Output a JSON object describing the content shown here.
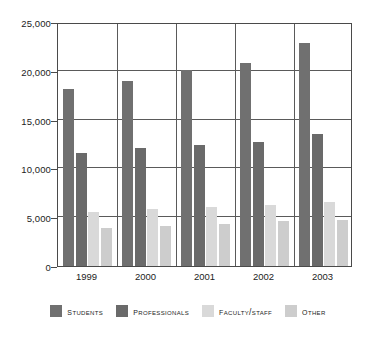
{
  "chart_data": {
    "type": "bar",
    "title": "",
    "xlabel": "",
    "ylabel": "",
    "categories": [
      "1999",
      "2000",
      "2001",
      "2002",
      "2003"
    ],
    "series": [
      {
        "name": "Students",
        "values": [
          18100,
          19000,
          20100,
          20800,
          22800
        ],
        "color": "#707070"
      },
      {
        "name": "Professionals",
        "values": [
          11600,
          12100,
          12400,
          12700,
          13500
        ],
        "color": "#6a6a6a"
      },
      {
        "name": "Faculty/Staff",
        "values": [
          5500,
          5800,
          6000,
          6250,
          6600
        ],
        "color": "#d9d9d9"
      },
      {
        "name": "Other",
        "values": [
          3900,
          4150,
          4350,
          4600,
          4750
        ],
        "color": "#cdcdcd"
      }
    ],
    "ylim": [
      0,
      25000
    ],
    "ytick_values": [
      0,
      5000,
      10000,
      15000,
      20000,
      25000
    ],
    "ytick_labels": [
      "0",
      "5,000",
      "10,000",
      "15,000",
      "20,000",
      "25,000"
    ],
    "grid": true,
    "grid_axis": "both",
    "legend_position": "bottom",
    "legend_entries": [
      "Students",
      "Professionals",
      "Faculty/Staff",
      "Other"
    ],
    "annotations": []
  },
  "axes": {
    "y_axis_name": "y-axis",
    "x_axis_name": "x-axis"
  }
}
